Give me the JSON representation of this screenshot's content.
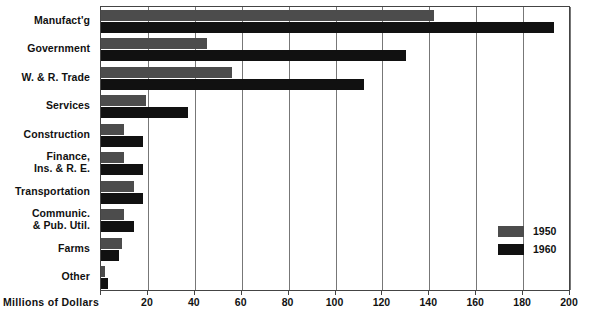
{
  "chart_data": {
    "type": "bar",
    "orientation": "horizontal",
    "title": "",
    "xlabel": "Millions of Dollars",
    "ylabel": "",
    "xlim": [
      0,
      200
    ],
    "xticks": [
      0,
      20,
      40,
      60,
      80,
      100,
      120,
      140,
      160,
      180,
      200
    ],
    "xtick_labels": [
      "",
      "20",
      "40",
      "60",
      "80",
      "100",
      "120",
      "140",
      "160",
      "180",
      "200"
    ],
    "grid": true,
    "legend_position": "right-lower",
    "categories": [
      "Manufact'g",
      "Government",
      "W. & R. Trade",
      "Services",
      "Construction",
      "Finance,\nIns. & R. E.",
      "Transportation",
      "Communic.\n& Pub. Util.",
      "Farms",
      "Other"
    ],
    "series": [
      {
        "name": "1950",
        "color": "#4c4c4c",
        "values": [
          142,
          45,
          56,
          19,
          10,
          10,
          14,
          10,
          9,
          1.5
        ]
      },
      {
        "name": "1960",
        "color": "#111111",
        "values": [
          193,
          130,
          112,
          37,
          18,
          18,
          18,
          14,
          7.5,
          3
        ]
      }
    ]
  },
  "legend": {
    "items": [
      {
        "label": "1950",
        "color": "#4c4c4c"
      },
      {
        "label": "1960",
        "color": "#111111"
      }
    ]
  },
  "axis": {
    "title": "Millions of Dollars"
  }
}
